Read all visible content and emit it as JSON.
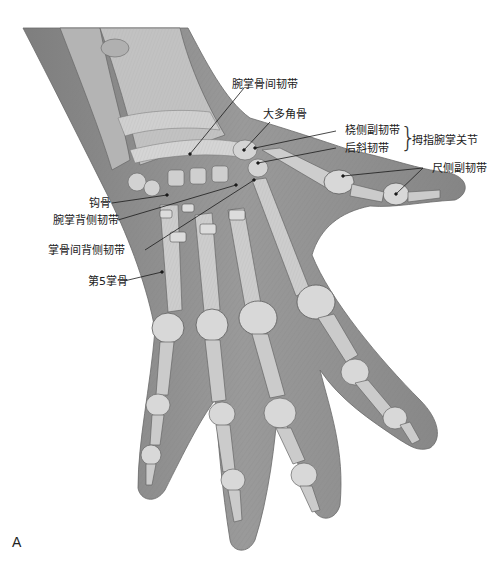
{
  "figure": {
    "panel_letter": "A",
    "colors": {
      "skin": "#8e8e8e",
      "skin_light": "#a7a7a7",
      "bone": "#cfcfcf",
      "bone_shade": "#b9b9b9",
      "outline": "#5c5c5c",
      "leader_line": "#1a1a1a",
      "background": "#ffffff"
    }
  },
  "labels": {
    "intermetacarpal_ligament": "腕掌骨间韧带",
    "trapezium": "大多角骨",
    "radial_collateral_ligament": "桡侧副韧带",
    "posterior_oblique_ligament": "后斜韧带",
    "thumb_cmc_joint": "拇指腕掌关节",
    "ulnar_collateral_ligament": "尺侧副韧带",
    "hamate": "钩骨",
    "dorsal_carpometacarpal_ligament": "腕掌背侧韧带",
    "dorsal_intermetacarpal_ligament": "掌骨间背侧韧带",
    "fifth_metacarpal": "第5掌骨"
  }
}
